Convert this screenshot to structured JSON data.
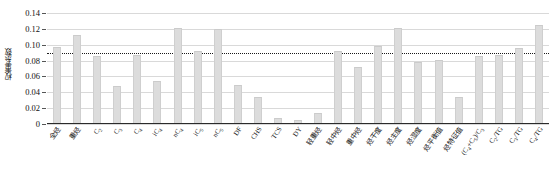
{
  "chart_data": {
    "type": "bar",
    "title": "",
    "xlabel": "",
    "ylabel": "权重系数",
    "ylim": [
      0,
      0.14
    ],
    "ytick_labels": [
      "0.14",
      "0.12",
      "0.10",
      "0.08",
      "0.06",
      "0.04",
      "0.02",
      "0"
    ],
    "ytick_values": [
      0.14,
      0.12,
      0.1,
      0.08,
      0.06,
      0.04,
      0.02,
      0
    ],
    "grid": true,
    "legend": "none",
    "threshold_line": {
      "value": 0.09,
      "style": "dotted",
      "color": "#1a1a1a"
    },
    "bar_color": "#dcdcdc",
    "categories": [
      "全烃",
      "重烃",
      "C₂",
      "C₃",
      "C₄",
      "iC₄",
      "nC₄",
      "iC₅",
      "nC₅",
      "DF",
      "CHS",
      "TCS",
      "DY",
      "轻重烃",
      "轻中烃",
      "重中烃",
      "烃干度",
      "烃主度",
      "烃湿度",
      "烃平衡值",
      "烃特征值",
      "(C₄+C₅)/C₃",
      "C₂/TG",
      "C₃/TG",
      "C₄/TG"
    ],
    "categories_html": [
      "全烃",
      "重烃",
      "C<sub>2</sub>",
      "C<sub>3</sub>",
      "C<sub>4</sub>",
      "iC<sub>4</sub>",
      "nC<sub>4</sub>",
      "iC<sub>5</sub>",
      "nC<sub>5</sub>",
      "DF",
      "CHS",
      "TCS",
      "DY",
      "轻重烃",
      "轻中烃",
      "重中烃",
      "烃干度",
      "烃主度",
      "烃湿度",
      "烃平衡值",
      "烃特征值",
      "(C<sub>4</sub>+C<sub>5</sub>)/C<sub>3</sub>",
      "C<sub>2</sub>/TG",
      "C<sub>3</sub>/TG",
      "C<sub>4</sub>/TG"
    ],
    "values": [
      0.094,
      0.11,
      0.083,
      0.045,
      0.085,
      0.052,
      0.118,
      0.089,
      0.117,
      0.047,
      0.032,
      0.005,
      0.003,
      0.012,
      0.09,
      0.069,
      0.096,
      0.118,
      0.076,
      0.078,
      0.032,
      0.083,
      0.085,
      0.093,
      0.122
    ]
  }
}
